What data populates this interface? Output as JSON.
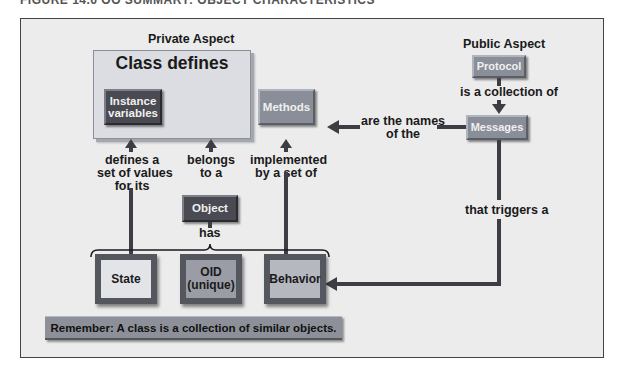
{
  "figure": {
    "title": "FIGURE 14.6  OO SUMMARY: OBJECT CHARACTERISTICS"
  },
  "private_aspect": {
    "label": "Private Aspect",
    "class_box": {
      "title": "Class defines",
      "instance_variables": "Instance variables",
      "instance_line1": "Instance",
      "instance_line2": "variables",
      "methods": "Methods"
    }
  },
  "public_aspect": {
    "label": "Public Aspect",
    "protocol": "Protocol",
    "protocol_to_messages": "is a collection of",
    "messages": "Messages"
  },
  "connectors": {
    "messages_to_methods_line1": "are the names",
    "messages_to_methods_line2": "of the",
    "state_to_instance_line1": "defines a",
    "state_to_instance_line2": "set of values",
    "state_to_instance_line3": "for its",
    "object_to_class_line1": "belongs",
    "object_to_class_line2": "to a",
    "behavior_to_methods_line1": "implemented",
    "behavior_to_methods_line2": "by a set of",
    "object_has": "has",
    "messages_to_behavior": "that triggers a"
  },
  "object": {
    "label": "Object",
    "has": [
      "State",
      "OID (unique)",
      "Behavior"
    ],
    "state": "State",
    "oid_line1": "OID",
    "oid_line2": "(unique)",
    "behavior": "Behavior"
  },
  "note": "Remember: A class is a collection of similar objects.",
  "colors": {
    "background": "#ececec",
    "dark_box": "#4a4a52",
    "mid_box": "#8a8e98",
    "class_box": "#dcdde2",
    "connector": "#3c3e44",
    "frame_border": "#444444"
  }
}
